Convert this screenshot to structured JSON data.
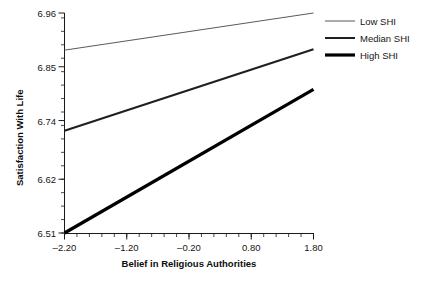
{
  "chart_data": {
    "type": "line",
    "title": "",
    "xlabel": "Belief in Religious Authorities",
    "ylabel": "Satisfaction With Life",
    "xlim": [
      -2.2,
      1.8
    ],
    "ylim": [
      6.51,
      6.96
    ],
    "xticks": [
      -2.2,
      -1.2,
      -0.2,
      0.8,
      1.8
    ],
    "xticklabels": [
      "–2.20",
      "–1.20",
      "–0.20",
      "0.80",
      "1.80"
    ],
    "yticks": [
      6.51,
      6.62,
      6.74,
      6.85,
      6.96
    ],
    "yticklabels": [
      "6.51",
      "6.62",
      "6.74",
      "6.85",
      "6.96"
    ],
    "minor_tick_step_x": 0.2,
    "minor_tick_step_y": 0.0275,
    "grid": false,
    "legend_position": "right",
    "x": [
      -2.2,
      1.8
    ],
    "series": [
      {
        "name": "Low SHI",
        "values": [
          6.884,
          6.96
        ],
        "color": "#5a5a5a",
        "line_width": 1.0
      },
      {
        "name": "Median SHI",
        "values": [
          6.719,
          6.886
        ],
        "color": "#1f1f1f",
        "line_width": 2.0
      },
      {
        "name": "High SHI",
        "values": [
          6.51,
          6.804
        ],
        "color": "#000000",
        "line_width": 3.2
      }
    ]
  },
  "legend": {
    "items": [
      {
        "label": "Low SHI"
      },
      {
        "label": "Median SHI"
      },
      {
        "label": "High SHI"
      }
    ]
  },
  "axes": {
    "x_title": "Belief in Religious Authorities",
    "y_title": "Satisfaction With Life",
    "x_tick_labels": [
      "–2.20",
      "–1.20",
      "–0.20",
      "0.80",
      "1.80"
    ],
    "y_tick_labels": [
      "6.51",
      "6.62",
      "6.74",
      "6.85",
      "6.96"
    ]
  },
  "colors": {
    "axis": "#1a1a1a",
    "text": "#161616",
    "low": "#5a5a5a",
    "median": "#1f1f1f",
    "high": "#000000",
    "background": "#ffffff"
  }
}
